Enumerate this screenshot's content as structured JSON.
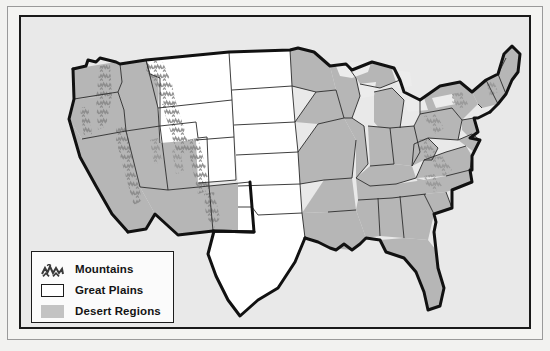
{
  "map": {
    "title": "United States Physical Regions Map",
    "background_color": "#e9e9e9",
    "frame_color": "#1a1a1a",
    "outline_color": "#111111",
    "state_border_color": "#2a2a2a",
    "region_colors": {
      "mountains": "#8e8e8e",
      "great_plains": "#ffffff",
      "desert_regions": "#b6b6b6",
      "lakes": "#ececec"
    }
  },
  "legend": {
    "items": [
      {
        "icon": "mountain-hatch-swatch",
        "label": "Mountains",
        "color": "#8e8e8e"
      },
      {
        "icon": "white-box-swatch",
        "label": "Great Plains",
        "color": "#ffffff"
      },
      {
        "icon": "gray-box-swatch",
        "label": "Desert Regions",
        "color": "#c3c3c3"
      }
    ]
  },
  "regions": {
    "mountain_ranges": [
      "Cascade Range",
      "Sierra Nevada",
      "Rocky Mountains",
      "Appalachian Mountains"
    ],
    "great_plains_states": [
      "Montana",
      "North Dakota",
      "South Dakota",
      "Nebraska",
      "Kansas",
      "Oklahoma",
      "Texas",
      "Wyoming",
      "Colorado"
    ],
    "desert_states": [
      "California",
      "Nevada",
      "Utah",
      "Arizona",
      "New Mexico",
      "Oregon",
      "Washington",
      "Idaho"
    ]
  }
}
